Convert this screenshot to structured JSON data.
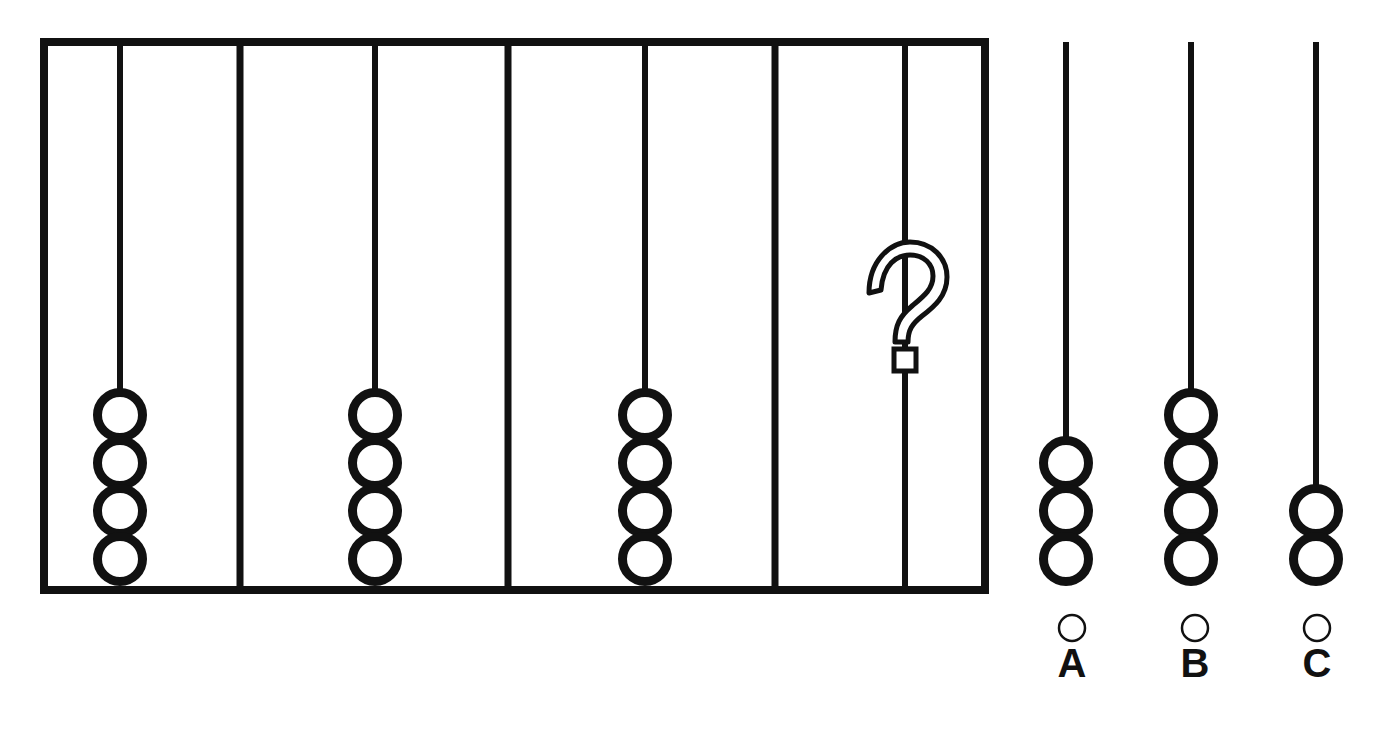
{
  "puzzle": {
    "type": "abacus-bead-sequence-matrix",
    "title": "Bead string sequence puzzle",
    "frame": {
      "name": "sequence-frame",
      "x": 44,
      "y": 42,
      "width": 941,
      "height": 548,
      "stroke_color": "#111111",
      "stroke_width": 8,
      "panel_divider_x": [
        240,
        508,
        775
      ]
    },
    "bead": {
      "diameter": 54,
      "stroke_color": "#111111",
      "stroke_width": 9,
      "fill_color": "#ffffff",
      "overlap": 6
    },
    "string": {
      "stroke_color": "#111111",
      "stroke_width": 6
    },
    "panels": [
      {
        "index": 1,
        "name": "sequence-panel-1",
        "label": "",
        "bead_count": 4,
        "string_x": 120,
        "string_top": 46,
        "bottom_y": 586,
        "has_question_mark": false
      },
      {
        "index": 2,
        "name": "sequence-panel-2",
        "label": "",
        "bead_count": 4,
        "string_x": 375,
        "string_top": 46,
        "bottom_y": 586,
        "has_question_mark": false
      },
      {
        "index": 3,
        "name": "sequence-panel-3",
        "label": "",
        "bead_count": 4,
        "string_x": 645,
        "string_top": 46,
        "bottom_y": 586,
        "has_question_mark": false
      },
      {
        "index": 4,
        "name": "sequence-panel-4-unknown",
        "label": "?",
        "bead_count": 0,
        "string_x": 905,
        "string_top": 46,
        "bottom_y": 586,
        "has_question_mark": true,
        "question_mark": {
          "glyph": "?",
          "center_x": 905,
          "center_y": 312,
          "style": "outlined"
        }
      }
    ],
    "options": [
      {
        "name": "answer-option-a",
        "letter": "A",
        "bead_count": 3,
        "string_x": 1066,
        "string_top": 42,
        "bead_bottom_y": 586,
        "bubble_cx": 1072,
        "bubble_cy": 628,
        "bubble_r": 13,
        "letter_x": 1072,
        "letter_y": 673,
        "selected": false
      },
      {
        "name": "answer-option-b",
        "letter": "B",
        "bead_count": 4,
        "string_x": 1191,
        "string_top": 42,
        "bead_bottom_y": 586,
        "bubble_cx": 1195,
        "bubble_cy": 628,
        "bubble_r": 13,
        "letter_x": 1195,
        "letter_y": 673,
        "selected": false
      },
      {
        "name": "answer-option-c",
        "letter": "C",
        "bead_count": 2,
        "string_x": 1316,
        "string_top": 42,
        "bead_bottom_y": 586,
        "bubble_cx": 1317,
        "bubble_cy": 628,
        "bubble_r": 13,
        "letter_x": 1317,
        "letter_y": 673,
        "selected": false
      }
    ],
    "colors": {
      "ink": "#111111",
      "paper": "#ffffff"
    }
  }
}
